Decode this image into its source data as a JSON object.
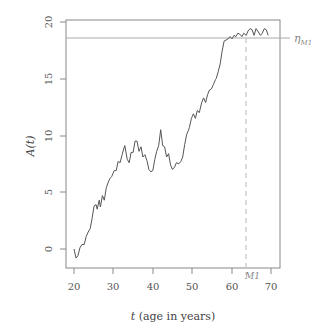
{
  "chart_data": {
    "type": "line",
    "title": "",
    "xlabel": "t (age in years)",
    "xlabel_italic_part": "t",
    "xlabel_rest": " (age in years)",
    "ylabel": "A(t)",
    "xlim": [
      18,
      72
    ],
    "ylim": [
      -1.7,
      20.3
    ],
    "x_ticks": [
      20,
      30,
      40,
      50,
      60,
      70
    ],
    "y_ticks": [
      0,
      5,
      10,
      15,
      20
    ],
    "grid": false,
    "legend": null,
    "series": [
      {
        "name": "A(t)",
        "color": "#555555",
        "x": [
          20.0,
          20.5,
          21.0,
          21.5,
          22.0,
          22.6,
          23.1,
          23.6,
          24.1,
          24.6,
          25.1,
          25.6,
          25.9,
          26.4,
          26.7,
          27.2,
          27.7,
          28.2,
          28.7,
          29.1,
          29.6,
          30.2,
          30.7,
          31.2,
          31.7,
          32.2,
          32.7,
          32.9,
          33.5,
          34.0,
          34.5,
          35.0,
          35.5,
          36.0,
          36.5,
          37.0,
          37.5,
          38.0,
          38.5,
          39.0,
          39.5,
          40.0,
          40.5,
          41.0,
          41.5,
          42.0,
          42.5,
          43.0,
          43.5,
          44.0,
          44.5,
          45.0,
          45.5,
          46.0,
          46.6,
          47.1,
          47.6,
          48.1,
          48.6,
          49.1,
          49.3,
          49.8,
          50.3,
          50.8,
          51.3,
          51.8,
          52.4,
          52.9,
          53.4,
          53.9,
          54.4,
          54.9,
          55.4,
          55.9,
          56.1,
          56.6,
          57.1,
          57.6,
          58.1,
          58.6,
          59.1,
          59.6,
          60.1,
          60.6,
          61.1,
          61.6,
          62.1,
          62.6,
          63.1,
          63.7,
          64.2,
          64.7,
          65.2,
          65.7,
          66.2,
          66.8,
          67.3,
          67.8,
          68.3,
          68.8,
          69.3
        ],
        "values": [
          0.0,
          -0.8,
          -0.6,
          0.1,
          0.4,
          0.4,
          1.1,
          1.5,
          1.8,
          2.7,
          3.8,
          3.9,
          3.5,
          4.3,
          3.7,
          4.7,
          4.3,
          5.4,
          5.9,
          6.2,
          6.4,
          6.9,
          6.9,
          7.7,
          7.6,
          8.3,
          8.9,
          9.1,
          7.9,
          7.6,
          8.5,
          8.5,
          9.5,
          9.5,
          8.6,
          9.0,
          8.1,
          8.3,
          7.8,
          7.0,
          6.8,
          6.9,
          7.9,
          8.6,
          9.1,
          10.5,
          9.1,
          9.0,
          8.1,
          8.4,
          7.4,
          7.0,
          7.2,
          7.6,
          7.5,
          7.7,
          8.1,
          9.2,
          10.1,
          10.5,
          10.7,
          11.5,
          11.9,
          11.5,
          12.2,
          12.0,
          12.9,
          13.3,
          12.9,
          13.6,
          14.0,
          14.1,
          14.5,
          14.9,
          15.0,
          15.6,
          16.3,
          17.4,
          18.3,
          18.4,
          18.5,
          18.7,
          18.5,
          18.8,
          18.7,
          19.0,
          18.9,
          18.7,
          19.0,
          18.8,
          19.2,
          19.4,
          19.3,
          18.8,
          19.4,
          19.1,
          18.8,
          19.0,
          19.4,
          19.3,
          18.8
        ]
      }
    ],
    "annotations": [
      {
        "type": "hline",
        "y": 18.6,
        "label": "η",
        "label_sub": "M1",
        "color": "#999999"
      },
      {
        "type": "vline",
        "x": 63.7,
        "label": "M1",
        "style": "dashed",
        "color": "#bbbbbb"
      }
    ]
  },
  "labels": {
    "y_axis_title": "A(t)",
    "x_axis_title_var": "t",
    "x_axis_title_rest": " (age in years)",
    "eta_symbol": "η",
    "eta_sub": "M1",
    "m1_label": "M1",
    "x_ticks": [
      "20",
      "30",
      "40",
      "50",
      "60",
      "70"
    ],
    "y_ticks": [
      "0",
      "5",
      "10",
      "15",
      "20"
    ]
  }
}
